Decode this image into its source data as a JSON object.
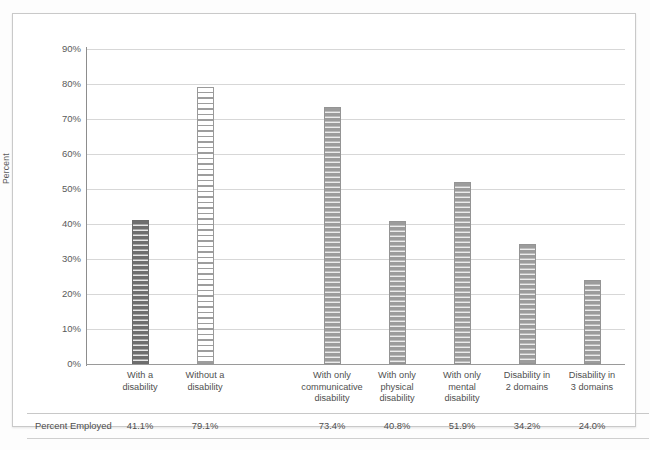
{
  "chart_data": {
    "type": "bar",
    "title": "",
    "subtitle": "",
    "xlabel": "",
    "ylabel": "Percent",
    "ylim": [
      0,
      90
    ],
    "ytick_labels": [
      "90%",
      "80%",
      "70%",
      "60%",
      "50%",
      "40%",
      "30%",
      "20%",
      "10%",
      "0%"
    ],
    "ytick_values": [
      90,
      80,
      70,
      60,
      50,
      40,
      30,
      20,
      10,
      0
    ],
    "grid": true,
    "legend": "none",
    "categories": [
      "With a disability",
      "Without a disability",
      "With only communicative disability",
      "With only physical disability",
      "With only mental disability",
      "Disability in 2 domains",
      "Disability in 3 domains"
    ],
    "category_lines": [
      [
        "With a",
        "disability"
      ],
      [
        "Without a",
        "disability"
      ],
      [
        "With only",
        "communicative",
        "disability"
      ],
      [
        "With only",
        "physical",
        "disability"
      ],
      [
        "With only",
        "mental",
        "disability"
      ],
      [
        "Disability in",
        "2 domains"
      ],
      [
        "Disability in",
        "3 domains"
      ]
    ],
    "values": [
      41.1,
      79.1,
      73.4,
      40.8,
      51.9,
      34.2,
      24.0
    ],
    "value_labels": [
      "41.1%",
      "79.1%",
      "73.4%",
      "40.8%",
      "51.9%",
      "34.2%",
      "24.0%"
    ],
    "bar_styles": [
      "dark",
      "light",
      "mid",
      "mid",
      "mid",
      "mid",
      "mid"
    ],
    "series": [
      {
        "name": "Percent Employed",
        "values": [
          41.1,
          79.1,
          73.4,
          40.8,
          51.9,
          34.2,
          24.0
        ]
      }
    ]
  },
  "table": {
    "row_label": "Percent Employed",
    "values": [
      "41.1%",
      "79.1%",
      "73.4%",
      "40.8%",
      "51.9%",
      "34.2%",
      "24.0%"
    ]
  },
  "colors": {
    "bar_dark": "#6e6e6e",
    "bar_light": "#ffffff",
    "bar_mid": "#9c9c9c",
    "gridline": "#d7d7d7",
    "axis": "#8d8d8d",
    "text": "#4f4f4f",
    "frame": "#c9c9c9"
  }
}
